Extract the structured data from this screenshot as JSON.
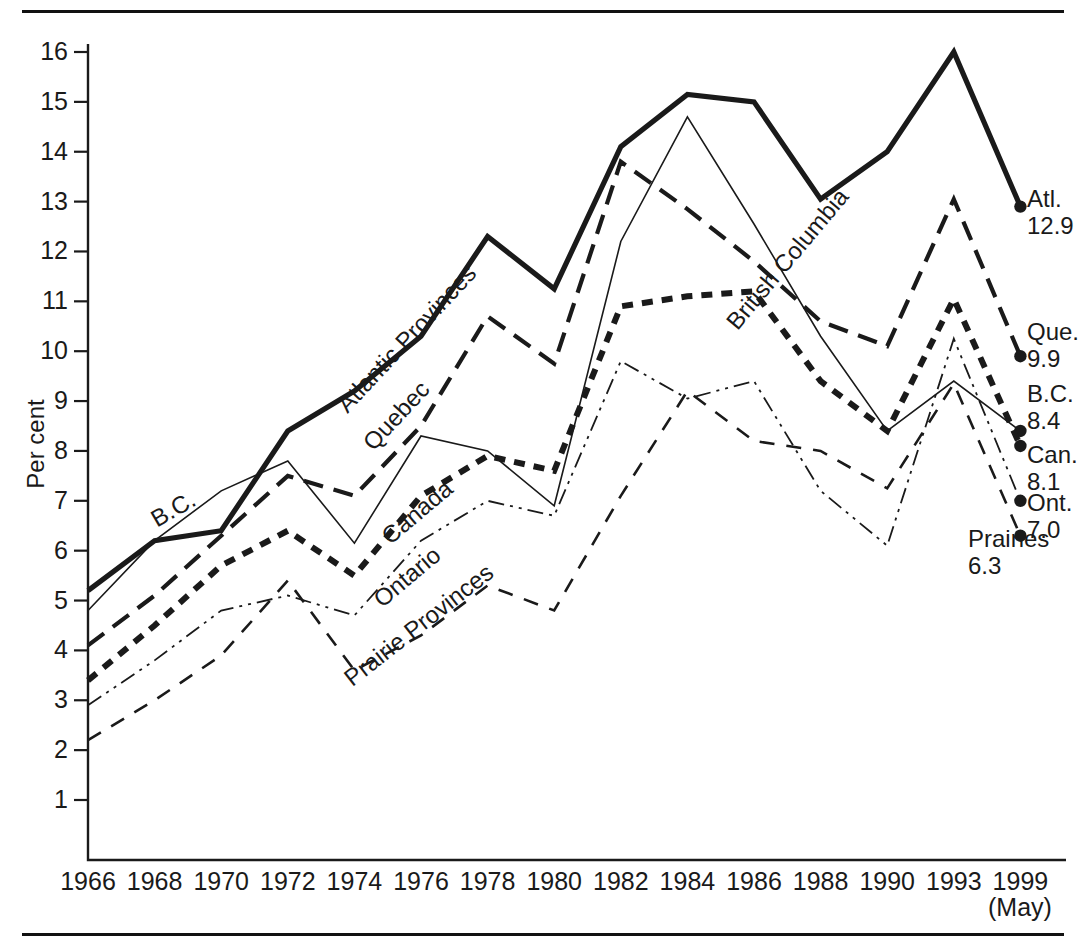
{
  "figure": {
    "y_axis_title": "Per cent",
    "x_sub_note": "(May)"
  },
  "chart_data": {
    "type": "line",
    "title": "",
    "xlabel": "",
    "ylabel": "Per cent",
    "ylim": [
      0,
      16.5
    ],
    "yticks": [
      1,
      2,
      3,
      4,
      5,
      6,
      7,
      8,
      9,
      10,
      11,
      12,
      13,
      14,
      15,
      16
    ],
    "ytick_labels": [
      "1",
      "2",
      "3",
      "4",
      "5",
      "6",
      "7",
      "8",
      "9",
      "10",
      "11",
      "12",
      "13",
      "14",
      "15",
      "16"
    ],
    "grid": false,
    "legend_position": "inline-along-lines-and-right-endpoints",
    "categories": [
      "1966",
      "1968",
      "1970",
      "1972",
      "1974",
      "1976",
      "1978",
      "1980",
      "1982",
      "1984",
      "1986",
      "1988",
      "1990",
      "1993",
      "1999"
    ],
    "x_tick_labels": [
      "1966",
      "1968",
      "1970",
      "1972",
      "1974",
      "1976",
      "1978",
      "1980",
      "1982",
      "1984",
      "1986",
      "1988",
      "1990",
      "1993",
      "1999"
    ],
    "series": [
      {
        "name": "Atlantic Provinces",
        "inline_label": "Atlantic Provinces",
        "end_label": "Atl.",
        "end_value": "12.9",
        "style": "solid-thick",
        "values": [
          5.2,
          6.2,
          6.4,
          8.4,
          9.2,
          10.3,
          12.3,
          11.25,
          14.1,
          15.15,
          15.0,
          13.05,
          14.0,
          16.0,
          12.9
        ]
      },
      {
        "name": "Quebec",
        "inline_label": "Quebec",
        "end_label": "Que.",
        "end_value": "9.9",
        "style": "dashed-medium",
        "values": [
          4.1,
          5.1,
          6.3,
          7.5,
          7.1,
          8.5,
          10.7,
          9.75,
          13.8,
          12.85,
          11.8,
          10.6,
          10.1,
          13.05,
          9.9
        ]
      },
      {
        "name": "British Columbia",
        "inline_label": "British Columbia",
        "end_label": "B.C.",
        "end_value": "8.4",
        "style": "solid-thin",
        "values": [
          4.8,
          6.2,
          7.2,
          7.8,
          6.15,
          8.3,
          8.0,
          6.9,
          12.2,
          14.7,
          12.55,
          10.3,
          8.4,
          9.4,
          8.4
        ]
      },
      {
        "name": "Canada",
        "inline_label": "Canada",
        "end_label": "Can.",
        "end_value": "8.1",
        "style": "dotted-thick",
        "values": [
          3.4,
          4.5,
          5.7,
          6.4,
          5.5,
          7.1,
          7.9,
          7.6,
          10.9,
          11.1,
          11.2,
          9.4,
          8.4,
          11.05,
          8.1
        ]
      },
      {
        "name": "Ontario",
        "inline_label": "Ontario",
        "end_label": "Ont.",
        "end_value": "7.0",
        "style": "dashdotdot-thin",
        "values": [
          2.9,
          3.8,
          4.8,
          5.1,
          4.7,
          6.2,
          7.0,
          6.7,
          9.8,
          9.05,
          9.4,
          7.2,
          6.1,
          10.25,
          7.0
        ]
      },
      {
        "name": "Prairie Provinces",
        "inline_label": "Prairie Provinces",
        "end_label": "Prairies",
        "end_value": "6.3",
        "style": "dashed-thin",
        "values": [
          2.2,
          3.0,
          3.9,
          5.4,
          3.6,
          4.3,
          5.3,
          4.8,
          7.1,
          9.2,
          8.2,
          8.0,
          7.25,
          9.35,
          6.3
        ]
      }
    ]
  },
  "inline_labels": [
    {
      "text": "B.C.",
      "x": 160,
      "y": 505,
      "rot": -30
    },
    {
      "text": "Atlantic Provinces",
      "x": 352,
      "y": 390,
      "rot": -47
    },
    {
      "text": "Quebec",
      "x": 378,
      "y": 428,
      "rot": -47
    },
    {
      "text": "Canada",
      "x": 394,
      "y": 522,
      "rot": -40
    },
    {
      "text": "Ontario",
      "x": 386,
      "y": 585,
      "rot": -40
    },
    {
      "text": "Prairie Provinces",
      "x": 356,
      "y": 664,
      "rot": -38
    },
    {
      "text": "British Columbia",
      "x": 742,
      "y": 307,
      "rot": -50
    }
  ],
  "end_labels": [
    {
      "name": "Atl.",
      "value": "12.9",
      "x": 1027,
      "y": 185
    },
    {
      "name": "Que.",
      "value": "9.9",
      "x": 1027,
      "y": 318
    },
    {
      "name": "B.C.",
      "value": "8.4",
      "x": 1027,
      "y": 380
    },
    {
      "name": "Can.",
      "value": "8.1",
      "x": 1027,
      "y": 441
    },
    {
      "name": "Ont.",
      "value": "7.0",
      "x": 1027,
      "y": 489
    },
    {
      "name": "Prairies",
      "value": "6.3",
      "x": 968,
      "y": 525
    }
  ]
}
